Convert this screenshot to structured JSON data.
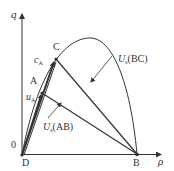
{
  "diagram": {
    "type": "vector diagram in q-rho plane",
    "axes": {
      "x_label": "ρ",
      "y_label": "q",
      "origin_label": "0"
    },
    "points": [
      {
        "name": "D",
        "label": "D"
      },
      {
        "name": "A",
        "label": "A"
      },
      {
        "name": "C",
        "label": "C"
      },
      {
        "name": "B",
        "label": "B"
      }
    ],
    "labels": {
      "c_a": {
        "main": "c",
        "sub": "A"
      },
      "u_a": {
        "main": "u",
        "sub": "A"
      },
      "us_bc": {
        "main": "U",
        "sub": "s",
        "paren": "(BC)"
      },
      "us_ab": {
        "main": "U",
        "sub": "s",
        "paren": "(AB)"
      }
    },
    "colors": {
      "line": "#333333",
      "text": "#333333",
      "background": "#ffffff"
    }
  }
}
